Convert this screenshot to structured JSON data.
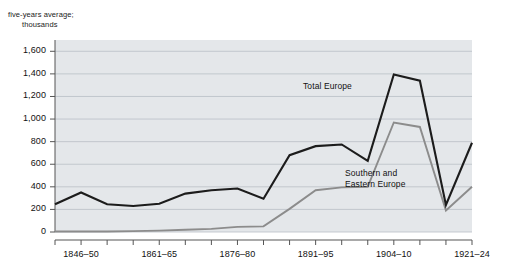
{
  "chart_data": {
    "type": "line",
    "title": "",
    "ylabel_line1": "five-years average;",
    "ylabel_line2": "thousands",
    "xlabel": "",
    "ylim": [
      0,
      1700
    ],
    "grid": true,
    "gridlines_on": "horizontal",
    "legend_position": "inline-annotation",
    "y_ticks": [
      "0",
      "200",
      "400",
      "600",
      "800",
      "1,000",
      "1,200",
      "1,400",
      "1,600"
    ],
    "y_tick_values": [
      0,
      200,
      400,
      600,
      800,
      1000,
      1200,
      1400,
      1600
    ],
    "categories": [
      "1841-45",
      "1846-50",
      "1851-55",
      "1856-60",
      "1861-65",
      "1866-70",
      "1871-75",
      "1876-80",
      "1881-85",
      "1886-90",
      "1891-95",
      "1896-00",
      "1901-03",
      "1904-10",
      "1911-14",
      "1915-20",
      "1921-24"
    ],
    "x_tick_labels_shown": [
      "1846-50",
      "1861-65",
      "1876-80",
      "1891-95",
      "1904-10",
      "1921-24"
    ],
    "x_tick_label_indices": [
      1,
      4,
      7,
      10,
      13,
      16
    ],
    "series": [
      {
        "name": "Total Europe",
        "color": "#1c1c1c",
        "annotation": "Total Europe",
        "values": [
          245,
          350,
          245,
          230,
          250,
          340,
          370,
          385,
          295,
          680,
          760,
          775,
          630,
          1395,
          1340,
          240,
          790
        ]
      },
      {
        "name": "Southern and Eastern Europe",
        "color": "#8c8c8c",
        "annotation_line1": "Southern and",
        "annotation_line2": "Eastern Europe",
        "values": [
          5,
          5,
          5,
          8,
          12,
          20,
          28,
          45,
          50,
          205,
          370,
          395,
          400,
          970,
          930,
          190,
          400
        ]
      }
    ],
    "plot_background": "#e4e7ea",
    "gridline_color": "#b9bfc6",
    "axis_color": "#555555"
  }
}
